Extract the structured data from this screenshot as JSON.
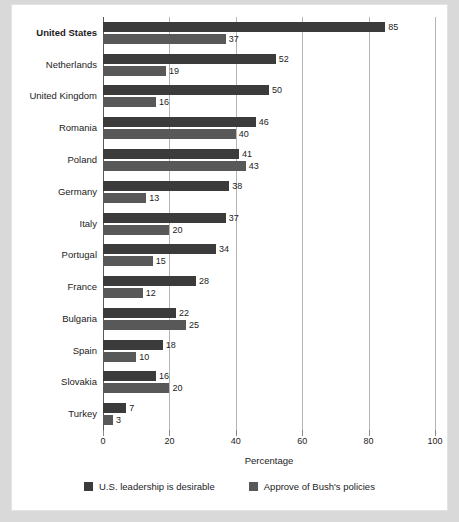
{
  "chart_data": {
    "type": "bar",
    "orientation": "horizontal",
    "title": "",
    "xlabel": "Percentage",
    "ylabel": "",
    "xlim": [
      0,
      100
    ],
    "xticks": [
      0,
      20,
      40,
      60,
      80,
      100
    ],
    "grid": true,
    "legend_position": "bottom",
    "emphasized_category": "United States",
    "categories": [
      "United States",
      "Netherlands",
      "United Kingdom",
      "Romania",
      "Poland",
      "Germany",
      "Italy",
      "Portugal",
      "France",
      "Bulgaria",
      "Spain",
      "Slovakia",
      "Turkey"
    ],
    "series": [
      {
        "name": "U.S. leadership is desirable",
        "color": "#3b3b3b",
        "values": [
          85,
          52,
          50,
          46,
          41,
          38,
          37,
          34,
          28,
          22,
          18,
          16,
          7
        ]
      },
      {
        "name": "Approve of Bush's policies",
        "color": "#585858",
        "values": [
          37,
          19,
          16,
          40,
          43,
          13,
          20,
          15,
          12,
          25,
          10,
          20,
          3
        ]
      }
    ]
  },
  "legend": {
    "items": [
      {
        "label": "U.S. leadership is desirable"
      },
      {
        "label": "Approve of Bush's policies"
      }
    ]
  },
  "axis": {
    "x_title": "Percentage",
    "tick_labels": [
      "0",
      "20",
      "40",
      "60",
      "80",
      "100"
    ]
  },
  "colors": {
    "series1": "#3b3b3b",
    "series2": "#585858",
    "gridline": "#b5b5b5",
    "axis": "#5a5a5a",
    "panel_background": "#ffffff",
    "page_background": "#d9d9d9",
    "text": "#1c1c1c"
  }
}
